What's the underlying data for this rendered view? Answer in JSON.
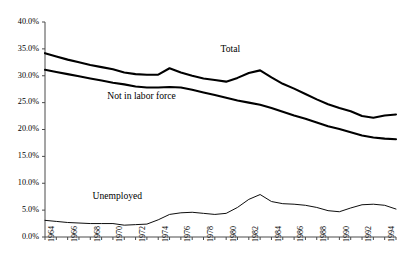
{
  "chart_data": {
    "type": "line",
    "title": "",
    "subtitle": "",
    "xlabel": "",
    "ylabel": "",
    "xlim": [
      1964,
      1995
    ],
    "ylim": [
      0,
      40
    ],
    "y_tick_labels": [
      "40.0%",
      "35.0%",
      "30.0%",
      "25.0%",
      "20.0%",
      "15.0%",
      "10.0%",
      "5.0%",
      "0.0%"
    ],
    "y_tick_values": [
      40,
      35,
      30,
      25,
      20,
      15,
      10,
      5,
      0
    ],
    "x_tick_labels": [
      "1964",
      "1966",
      "1968",
      "1970",
      "1972",
      "1974",
      "1976",
      "1978",
      "1980",
      "1982",
      "1984",
      "1986",
      "1988",
      "1990",
      "1992",
      "1994"
    ],
    "x_tick_values": [
      1964,
      1966,
      1968,
      1970,
      1972,
      1974,
      1976,
      1978,
      1980,
      1982,
      1984,
      1986,
      1988,
      1990,
      1992,
      1994
    ],
    "x_minor_tick_step": 1,
    "grid": false,
    "legend_position": "inline-annotations",
    "line_color": "#000000",
    "axis_color": "#4a4a4a",
    "x": [
      1964,
      1965,
      1966,
      1967,
      1968,
      1969,
      1970,
      1971,
      1972,
      1973,
      1974,
      1975,
      1976,
      1977,
      1978,
      1979,
      1980,
      1981,
      1982,
      1983,
      1984,
      1985,
      1986,
      1987,
      1988,
      1989,
      1990,
      1991,
      1992,
      1993,
      1994,
      1995
    ],
    "series": [
      {
        "name": "Total",
        "label": "Total",
        "line_width": 2.1,
        "values": [
          34.2,
          33.6,
          33.0,
          32.5,
          32.0,
          31.6,
          31.2,
          30.6,
          30.3,
          30.2,
          30.2,
          31.4,
          30.6,
          30.0,
          29.5,
          29.2,
          28.9,
          29.6,
          30.5,
          31.0,
          29.7,
          28.5,
          27.6,
          26.6,
          25.6,
          24.7,
          24.0,
          23.4,
          22.5,
          22.2,
          22.6,
          22.8
        ],
        "annotation": {
          "text": "Total",
          "x": 1979.5,
          "y": 35.0
        }
      },
      {
        "name": "Not in labor force",
        "label": "Not in labor force",
        "line_width": 2.1,
        "values": [
          31.1,
          30.7,
          30.3,
          29.9,
          29.5,
          29.1,
          28.7,
          28.4,
          28.0,
          27.8,
          27.8,
          27.9,
          27.8,
          27.4,
          26.9,
          26.4,
          25.9,
          25.4,
          25.0,
          24.6,
          24.0,
          23.3,
          22.6,
          22.0,
          21.3,
          20.6,
          20.1,
          19.5,
          18.9,
          18.5,
          18.3,
          18.2
        ],
        "annotation": {
          "text": "Not in labor force",
          "x": 1969.5,
          "y": 26.2
        }
      },
      {
        "name": "Unemployed",
        "label": "Unemployed",
        "line_width": 0.95,
        "values": [
          3.1,
          2.9,
          2.7,
          2.6,
          2.5,
          2.5,
          2.5,
          2.2,
          2.3,
          2.4,
          3.2,
          4.2,
          4.5,
          4.6,
          4.4,
          4.2,
          4.4,
          5.5,
          7.0,
          7.9,
          6.6,
          6.2,
          6.1,
          5.9,
          5.5,
          4.9,
          4.7,
          5.4,
          6.0,
          6.1,
          5.9,
          5.2
        ],
        "annotation": {
          "text": "Unemployed",
          "x": 1968.2,
          "y": 7.6
        }
      }
    ]
  }
}
